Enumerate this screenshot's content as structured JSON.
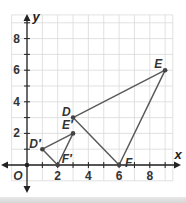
{
  "chart_data": {
    "type": "scatter",
    "title": "",
    "xlabel": "x",
    "ylabel": "y",
    "origin_label": "O",
    "xlim": [
      -1,
      9.5
    ],
    "ylim": [
      -1,
      9.5
    ],
    "grid": true,
    "x_ticks": [
      2,
      4,
      6,
      8
    ],
    "y_ticks": [
      2,
      4,
      6,
      8
    ],
    "series": [
      {
        "name": "Triangle DEF",
        "closed": true,
        "points": [
          {
            "label": "D",
            "x": 3,
            "y": 3
          },
          {
            "label": "E",
            "x": 9,
            "y": 6
          },
          {
            "label": "F",
            "x": 6,
            "y": 0
          }
        ]
      },
      {
        "name": "Triangle D'E'F'",
        "closed": true,
        "points": [
          {
            "label": "D′",
            "x": 1,
            "y": 1
          },
          {
            "label": "E′",
            "x": 3,
            "y": 2
          },
          {
            "label": "F′",
            "x": 2,
            "y": 0
          }
        ]
      }
    ],
    "colors": {
      "line": "#5a5a5a",
      "point": "#444444",
      "grid": "#d9d9d9",
      "axis": "#222222"
    }
  }
}
